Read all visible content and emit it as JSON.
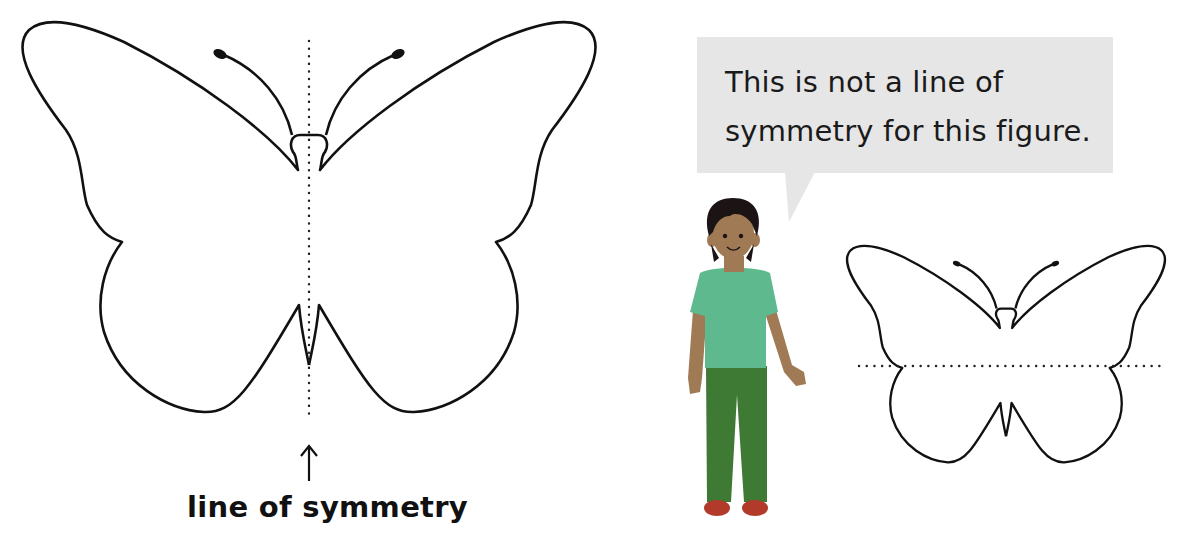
{
  "figure": {
    "left_panel": {
      "label": "line of symmetry",
      "arrow_glyph": "↑",
      "figure": "butterfly",
      "line_orientation": "vertical",
      "line_style": "dotted"
    },
    "right_panel": {
      "speech_bubble_text_line1": "This is not a line of",
      "speech_bubble_text_line2": "symmetry for this figure.",
      "figure": "butterfly",
      "line_orientation": "horizontal",
      "line_style": "dotted",
      "character": "child"
    },
    "colors": {
      "outline": "#111111",
      "bubble": "#e6e6e6",
      "shirt": "#5fb98f",
      "pants": "#3f7a35",
      "skin": "#a07a55",
      "hair": "#1c1414",
      "shoes": "#b13a2a"
    }
  }
}
